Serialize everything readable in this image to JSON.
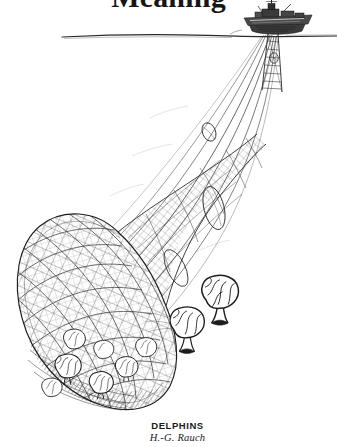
{
  "page": {
    "width": 337,
    "height": 447,
    "background_color": "#ffffff",
    "ink_color": "#1a1a1a"
  },
  "title": {
    "text": "Meaning",
    "clipped": "top"
  },
  "artwork": {
    "name": "DELPHINS",
    "medium": "pen-and-ink engraving",
    "description": "A ship at the ocean surface trawls an enormous net filled with brain-shaped dolphins; two brains swim free outside the net.",
    "elements": {
      "waterline_label": "sea-surface-horizon",
      "ship_label": "trawler-ship",
      "net_label": "trawl-net",
      "catch_label": "captured-brains",
      "free_brains_label": "escaping-brains",
      "otter_board_label": "otter-board"
    }
  },
  "caption": {
    "work_title": "DELPHINS",
    "artist": "H.-G. Rauch"
  }
}
